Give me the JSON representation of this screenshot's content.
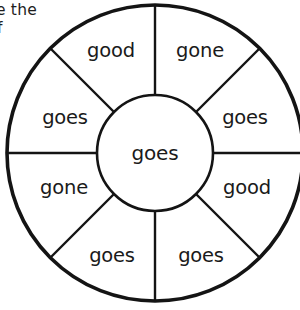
{
  "page": {
    "background_color": "#ffffff",
    "ink_color": "#141414"
  },
  "instructions": {
    "line1": "e the",
    "line2": "f"
  },
  "wheel": {
    "hub": {
      "label": "goes"
    },
    "segments": [
      {
        "id": "segment-top-left",
        "label": "good",
        "position": "top-left"
      },
      {
        "id": "segment-top-right",
        "label": "gone",
        "position": "top-right"
      },
      {
        "id": "segment-right-upper",
        "label": "goes",
        "position": "right-upper"
      },
      {
        "id": "segment-right-lower",
        "label": "good",
        "position": "right-lower"
      },
      {
        "id": "segment-bottom-right",
        "label": "goes",
        "position": "bottom-right"
      },
      {
        "id": "segment-bottom-left",
        "label": "goes",
        "position": "bottom-left"
      },
      {
        "id": "segment-left-lower",
        "label": "gone",
        "position": "left-lower"
      },
      {
        "id": "segment-left-upper",
        "label": "goes",
        "position": "left-upper"
      }
    ]
  }
}
